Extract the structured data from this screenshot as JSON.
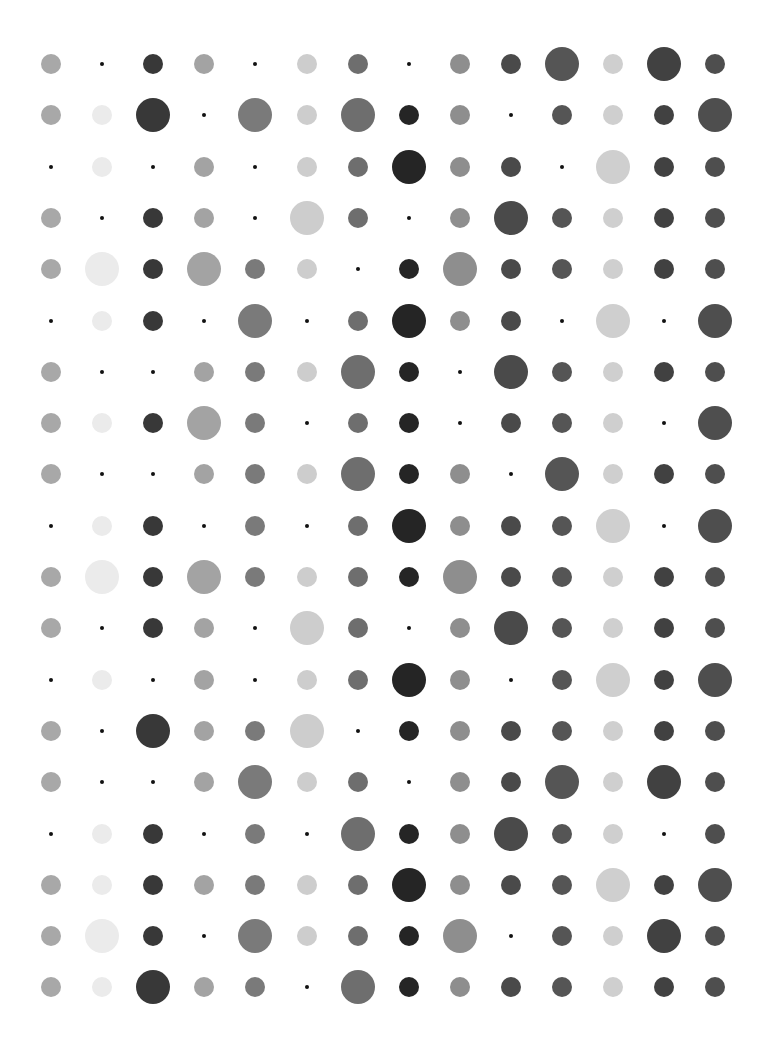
{
  "grid": {
    "columns": 14,
    "rows": 19,
    "origin_x": 51,
    "origin_y": 64,
    "spacing_x": 51.1,
    "spacing_y": 51.3,
    "size_legend": {
      "0": "tiny",
      "1": "medium",
      "2": "large"
    },
    "column_colors": [
      "#a8a8a8",
      "#ebebeb",
      "#383838",
      "#a3a3a3",
      "#7a7a7a",
      "#cdcdcd",
      "#6e6e6e",
      "#252525",
      "#8e8e8e",
      "#4a4a4a",
      "#555555",
      "#cfcfcf",
      "#414141",
      "#4e4e4e"
    ],
    "tiny_color": "#111111",
    "sizes": [
      [
        1,
        0,
        1,
        1,
        0,
        1,
        1,
        0,
        1,
        1,
        2,
        1,
        2,
        1
      ],
      [
        1,
        1,
        2,
        0,
        2,
        1,
        2,
        1,
        1,
        0,
        1,
        1,
        1,
        2
      ],
      [
        0,
        1,
        0,
        1,
        0,
        1,
        1,
        2,
        1,
        1,
        0,
        2,
        1,
        1
      ],
      [
        1,
        0,
        1,
        1,
        0,
        2,
        1,
        0,
        1,
        2,
        1,
        1,
        1,
        1
      ],
      [
        1,
        2,
        1,
        2,
        1,
        1,
        0,
        1,
        2,
        1,
        1,
        1,
        1,
        1
      ],
      [
        0,
        1,
        1,
        0,
        2,
        0,
        1,
        2,
        1,
        1,
        0,
        2,
        0,
        2
      ],
      [
        1,
        0,
        0,
        1,
        1,
        1,
        2,
        1,
        0,
        2,
        1,
        1,
        1,
        1
      ],
      [
        1,
        1,
        1,
        2,
        1,
        0,
        1,
        1,
        0,
        1,
        1,
        1,
        0,
        2
      ],
      [
        1,
        0,
        0,
        1,
        1,
        1,
        2,
        1,
        1,
        0,
        2,
        1,
        1,
        1
      ],
      [
        0,
        1,
        1,
        0,
        1,
        0,
        1,
        2,
        1,
        1,
        1,
        2,
        0,
        2
      ],
      [
        1,
        2,
        1,
        2,
        1,
        1,
        1,
        1,
        2,
        1,
        1,
        1,
        1,
        1
      ],
      [
        1,
        0,
        1,
        1,
        0,
        2,
        1,
        0,
        1,
        2,
        1,
        1,
        1,
        1
      ],
      [
        0,
        1,
        0,
        1,
        0,
        1,
        1,
        2,
        1,
        0,
        1,
        2,
        1,
        2
      ],
      [
        1,
        0,
        2,
        1,
        1,
        2,
        0,
        1,
        1,
        1,
        1,
        1,
        1,
        1
      ],
      [
        1,
        0,
        0,
        1,
        2,
        1,
        1,
        0,
        1,
        1,
        2,
        1,
        2,
        1
      ],
      [
        0,
        1,
        1,
        0,
        1,
        0,
        2,
        1,
        1,
        2,
        1,
        1,
        0,
        1
      ],
      [
        1,
        1,
        1,
        1,
        1,
        1,
        1,
        2,
        1,
        1,
        1,
        2,
        1,
        2
      ],
      [
        1,
        2,
        1,
        0,
        2,
        1,
        1,
        1,
        2,
        0,
        1,
        1,
        2,
        1
      ],
      [
        1,
        1,
        2,
        1,
        1,
        0,
        2,
        1,
        1,
        1,
        1,
        1,
        1,
        1
      ]
    ]
  }
}
